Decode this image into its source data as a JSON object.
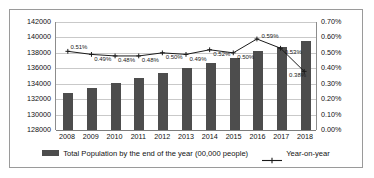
{
  "chart_data": {
    "type": "bar",
    "title": "",
    "subtitle": "",
    "xlabel": "",
    "ylabel": "",
    "grid": true,
    "legend_position": "bottom",
    "categories": [
      "2008",
      "2009",
      "2010",
      "2011",
      "2012",
      "2013",
      "2014",
      "2015",
      "2016",
      "2017",
      "2018"
    ],
    "axes": {
      "left": {
        "label": "Total Population by the end of the year (00,000 people)",
        "min": 128000,
        "max": 142000,
        "step": 2000,
        "ticks": [
          "128000",
          "130000",
          "132000",
          "134000",
          "136000",
          "138000",
          "140000",
          "142000"
        ]
      },
      "right": {
        "label": "Year-on-year",
        "min": 0.0,
        "max": 0.7,
        "step": 0.1,
        "ticks": [
          "0.00%",
          "0.10%",
          "0.20%",
          "0.30%",
          "0.40%",
          "0.50%",
          "0.60%",
          "0.70%"
        ]
      }
    },
    "series": [
      {
        "name": "Total Population by the end of the year (00,000 people)",
        "type": "bar",
        "axis": "left",
        "color": "#4d4d4d",
        "values": [
          132800,
          133450,
          134100,
          134700,
          135400,
          136000,
          136700,
          137400,
          138200,
          138800,
          139500
        ]
      },
      {
        "name": "Year-on-year",
        "type": "line",
        "axis": "right",
        "color": "#1a1a1a",
        "values": [
          0.51,
          0.49,
          0.48,
          0.48,
          0.5,
          0.49,
          0.52,
          0.5,
          0.59,
          0.53,
          0.38
        ],
        "labels": [
          "0.51%",
          "0.49%",
          "0.48%",
          "0.48%",
          "0.50%",
          "0.49%",
          "0.52%",
          "0.50%",
          "0.59%",
          "0.53%",
          "0.38%"
        ]
      }
    ]
  },
  "legend": {
    "items": [
      {
        "label": "Total Population by the end of the year (00,000 people)",
        "marker": "bar-swatch"
      },
      {
        "label": "Year-on-year",
        "marker": "line-marker"
      }
    ]
  }
}
